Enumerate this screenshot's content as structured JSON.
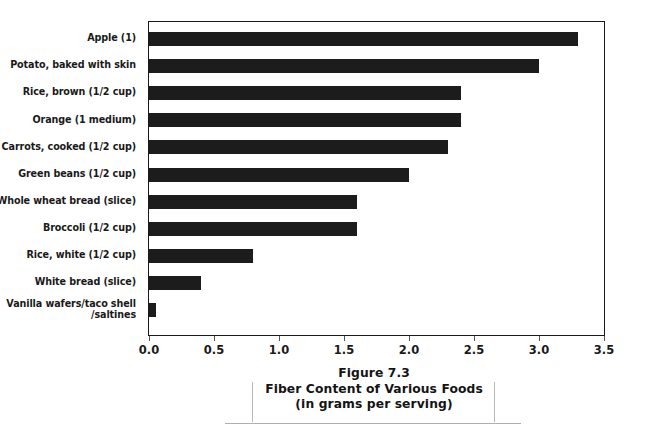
{
  "figure": {
    "caption_lines": [
      "Figure 7.3",
      "Fiber Content of Various Foods",
      "(in grams per serving)"
    ]
  },
  "axis": {
    "tick_labels": [
      "0.0",
      "0.5",
      "1.0",
      "1.5",
      "2.0",
      "2.5",
      "3.0",
      "3.5"
    ]
  },
  "colors": {
    "bar": "#1c1c1c",
    "frame": "#1a1a1a",
    "text": "#1a1a1a",
    "background": "#ffffff",
    "caption_rule": "#b9b9b9"
  },
  "chart_data": {
    "type": "bar",
    "orientation": "horizontal",
    "title": "Fiber Content of Various Foods",
    "subtitle": "(in grams per serving)",
    "figure_number": "Figure 7.3",
    "xlabel": "",
    "ylabel": "",
    "xlim": [
      0.0,
      3.5
    ],
    "xticks": [
      0.0,
      0.5,
      1.0,
      1.5,
      2.0,
      2.5,
      3.0,
      3.5
    ],
    "grid": false,
    "legend": false,
    "categories": [
      "Apple (1)",
      "Potato, baked with skin",
      "Rice, brown (1/2 cup)",
      "Orange (1 medium)",
      "Carrots, cooked (1/2 cup)",
      "Green beans (1/2 cup)",
      "Whole wheat bread (slice)",
      "Broccoli (1/2 cup)",
      "Rice, white (1/2 cup)",
      "White bread (slice)",
      "Vanilla wafers/taco shell\n/saltines"
    ],
    "values": [
      3.3,
      3.0,
      2.4,
      2.4,
      2.3,
      2.0,
      1.6,
      1.6,
      0.8,
      0.4,
      0.05
    ]
  }
}
